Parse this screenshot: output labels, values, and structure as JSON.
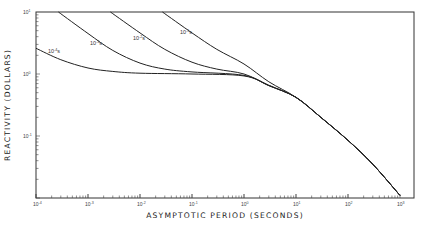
{
  "chart_data": {
    "type": "line",
    "title": "",
    "xlabel": "ASYMPTOTIC PERIOD (SECONDS)",
    "ylabel": "REACTIVITY (DOLLARS)",
    "xscale": "log",
    "yscale": "log",
    "xlim": [
      0.0001,
      1000
    ],
    "ylim": [
      0.01,
      10
    ],
    "grid": false,
    "legend": "inline curve labels",
    "x_ticks": [
      {
        "base": "10",
        "exp": "-4",
        "value": 0.0001
      },
      {
        "base": "10",
        "exp": "-3",
        "value": 0.001
      },
      {
        "base": "10",
        "exp": "-2",
        "value": 0.01
      },
      {
        "base": "10",
        "exp": "-1",
        "value": 0.1
      },
      {
        "base": "10",
        "exp": "0",
        "value": 1
      },
      {
        "base": "10",
        "exp": "1",
        "value": 10
      },
      {
        "base": "10",
        "exp": "2",
        "value": 100
      },
      {
        "base": "10",
        "exp": "3",
        "value": 1000
      }
    ],
    "y_ticks": [
      {
        "base": "10",
        "exp": "1",
        "value": 10
      },
      {
        "base": "10",
        "exp": "0",
        "value": 1
      },
      {
        "base": "10",
        "exp": "-1",
        "value": 0.1
      }
    ],
    "series": [
      {
        "name": "10^-4 s",
        "label_base": "10",
        "label_exp": "-4",
        "label_unit": "s",
        "x": [
          0.0001,
          0.0003,
          0.001,
          0.003,
          0.01,
          0.1,
          1,
          3,
          10,
          30,
          100,
          300,
          1000
        ],
        "y": [
          2.6,
          1.7,
          1.25,
          1.1,
          1.03,
          1.0,
          0.93,
          0.65,
          0.42,
          0.2,
          0.085,
          0.035,
          0.011
        ]
      },
      {
        "name": "10^-3 s",
        "label_base": "10",
        "label_exp": "-3",
        "label_unit": "s",
        "x": [
          0.00027,
          0.001,
          0.003,
          0.01,
          0.03,
          0.1,
          1,
          3,
          10,
          30,
          100,
          300,
          1000
        ],
        "y": [
          10,
          4.5,
          2.4,
          1.5,
          1.2,
          1.08,
          0.95,
          0.65,
          0.42,
          0.2,
          0.085,
          0.035,
          0.011
        ]
      },
      {
        "name": "10^-2 s",
        "label_base": "10",
        "label_exp": "-2",
        "label_unit": "s",
        "x": [
          0.0027,
          0.01,
          0.03,
          0.1,
          0.3,
          1,
          3,
          10,
          30,
          100,
          300,
          1000
        ],
        "y": [
          10,
          4.6,
          2.5,
          1.55,
          1.2,
          1.0,
          0.66,
          0.42,
          0.2,
          0.085,
          0.035,
          0.011
        ]
      },
      {
        "name": "10^-1 s",
        "label_base": "10",
        "label_exp": "-1",
        "label_unit": "s",
        "x": [
          0.027,
          0.1,
          0.3,
          1,
          3,
          10,
          30,
          100,
          300,
          1000
        ],
        "y": [
          10,
          4.6,
          2.5,
          1.45,
          0.75,
          0.42,
          0.2,
          0.085,
          0.035,
          0.011
        ]
      }
    ],
    "reference_line": {
      "y": 10,
      "description": "horizontal line at top of plot at 1 dollar x 10"
    }
  },
  "plot_area": {
    "left": 36,
    "right": 414,
    "top": 12,
    "bottom": 198
  }
}
